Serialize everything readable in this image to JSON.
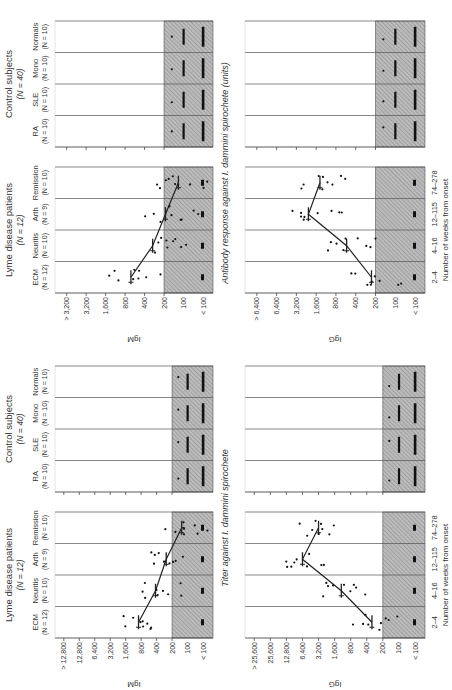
{
  "figures": [
    {
      "ylabel_shared": "Titer against I. dammini spirochete",
      "group_titles": [
        {
          "label": "Lyme disease patients",
          "n": "(N = 12)"
        },
        {
          "label": "Control subjects",
          "n": "(N = 40)"
        }
      ],
      "lyme_columns": [
        {
          "name": "ECM",
          "n": "(N = 12)",
          "weeks": "2–4"
        },
        {
          "name": "Neuritis",
          "n": "(N = 10)",
          "weeks": "4–16"
        },
        {
          "name": "Arth",
          "n": "(N = 9)",
          "weeks": "12–115"
        },
        {
          "name": "Remission",
          "n": "(N = 10)",
          "weeks": "74–278"
        }
      ],
      "control_columns": [
        {
          "name": "RA",
          "n": "(N = 10)"
        },
        {
          "name": "SLE",
          "n": "(N = 10)"
        },
        {
          "name": "Mono",
          "n": "(N = 10)"
        },
        {
          "name": "Normals",
          "n": "(N = 10)"
        }
      ],
      "xlabel": "Number of weeks from onset",
      "panels": [
        {
          "ylabel": "IgM",
          "ticks": [
            "< 100",
            "100",
            "200",
            "400",
            "800",
            "1,600",
            "3,200",
            "6,400",
            "12,800",
            "> 12,800"
          ]
        },
        {
          "ylabel": "IgG",
          "ticks": [
            "< 100",
            "100",
            "200",
            "400",
            "800",
            "1,600",
            "3,200",
            "6,400",
            "12,800",
            "25,600",
            "> 25,600"
          ]
        }
      ]
    },
    {
      "ylabel_shared": "Antibody response against I. dammini spirochete (units)",
      "group_titles": [
        {
          "label": "Lyme disease patients",
          "n": "(N = 12)"
        },
        {
          "label": "Control subjects",
          "n": "(N = 40)"
        }
      ],
      "lyme_columns": [
        {
          "name": "ECM",
          "n": "(N = 12)",
          "weeks": "2–4"
        },
        {
          "name": "Neuritis",
          "n": "(N = 10)",
          "weeks": "4–16"
        },
        {
          "name": "Arth",
          "n": "(N = 9)",
          "weeks": "12–115"
        },
        {
          "name": "Remission",
          "n": "(N = 10)",
          "weeks": "74–278"
        }
      ],
      "control_columns": [
        {
          "name": "RA",
          "n": "(N = 10)"
        },
        {
          "name": "SLE",
          "n": "(N = 10)"
        },
        {
          "name": "Mono",
          "n": "(N = 10)"
        },
        {
          "name": "Normals",
          "n": "(N = 10)"
        }
      ],
      "xlabel": "Number of weeks from onset",
      "panels": [
        {
          "ylabel": "IgM",
          "ticks": [
            "< 100",
            "100",
            "200",
            "400",
            "800",
            "1,600",
            "3,200",
            "> 3,200"
          ]
        },
        {
          "ylabel": "IgG",
          "ticks": [
            "< 100",
            "100",
            "200",
            "400",
            "800",
            "1,600",
            "3,200",
            "6,400",
            "> 6,400"
          ]
        }
      ]
    }
  ],
  "chart_data": [
    {
      "type": "scatter",
      "title": "Titer against I. dammini spirochete — IgM",
      "ylabel": "IgM",
      "categories": [
        "ECM 2–4",
        "Neuritis 4–16",
        "Arth 12–115",
        "Remission 74–278",
        "RA",
        "SLE",
        "Mono",
        "Normals"
      ],
      "series": [
        {
          "name": "Geometric mean (Lyme)",
          "values": [
            900,
            420,
            260,
            130,
            null,
            null,
            null,
            null
          ]
        }
      ],
      "shaded_region": "≤ 200",
      "yscale": "log2"
    },
    {
      "type": "scatter",
      "title": "Titer against I. dammini spirochete — IgG",
      "ylabel": "IgG",
      "categories": [
        "ECM 2–4",
        "Neuritis 4–16",
        "Arth 12–115",
        "Remission 74–278",
        "RA",
        "SLE",
        "Mono",
        "Normals"
      ],
      "series": [
        {
          "name": "Geometric mean (Lyme)",
          "values": [
            320,
            1200,
            6400,
            3200,
            null,
            null,
            null,
            null
          ]
        }
      ],
      "shaded_region": "≤ 200",
      "yscale": "log2"
    },
    {
      "type": "scatter",
      "title": "Antibody response (units) — IgM",
      "ylabel": "IgM",
      "categories": [
        "ECM 2–4",
        "Neuritis 4–16",
        "Arth 12–115",
        "Remission 74–278",
        "RA",
        "SLE",
        "Mono",
        "Normals"
      ],
      "series": [
        {
          "name": "Geometric mean (Lyme)",
          "values": [
            650,
            300,
            190,
            120,
            null,
            null,
            null,
            null
          ]
        }
      ],
      "shaded_region": "≤ 200",
      "yscale": "log2"
    },
    {
      "type": "scatter",
      "title": "Antibody response (units) — IgG",
      "ylabel": "IgG",
      "categories": [
        "ECM 2–4",
        "Neuritis 4–16",
        "Arth 12–115",
        "Remission 74–278",
        "RA",
        "SLE",
        "Mono",
        "Normals"
      ],
      "series": [
        {
          "name": "Geometric mean (Lyme)",
          "values": [
            230,
            550,
            2100,
            1400,
            null,
            null,
            null,
            null
          ]
        }
      ],
      "shaded_region": "≤ 200",
      "yscale": "log2"
    }
  ]
}
